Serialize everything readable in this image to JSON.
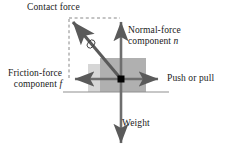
{
  "figure": {
    "labels": {
      "contact_force": "Contact force",
      "normal_force_line1": "Normal-force",
      "normal_force_line2_prefix": "component ",
      "normal_force_symbol": "n",
      "friction_force_line1": "Friction-force",
      "friction_force_line2_prefix": "component ",
      "friction_force_symbol": "f",
      "push_or_pull": "Push or pull",
      "weight": "Weight"
    },
    "colors": {
      "stroke": "#6e6e6e",
      "arrow_dark": "#5a5a5a",
      "text": "#1a1a1a",
      "block_fill": "#b3b3b3",
      "band_fill": "#d2d2d2",
      "ground_line": "#8a8a8a",
      "origin_dot": "#000000",
      "dashed": "#7a7a7a"
    },
    "geometry": {
      "origin_x": 121,
      "origin_y": 79,
      "normal_tip_y": 18,
      "weight_tip_y": 148,
      "friction_tip_x": 70,
      "push_tip_x": 163,
      "contact_tip_x": 69,
      "contact_tip_y": 18,
      "ground_y": 92,
      "block_left": 100,
      "block_right": 146,
      "block_top": 58,
      "band_left": 88
    }
  }
}
